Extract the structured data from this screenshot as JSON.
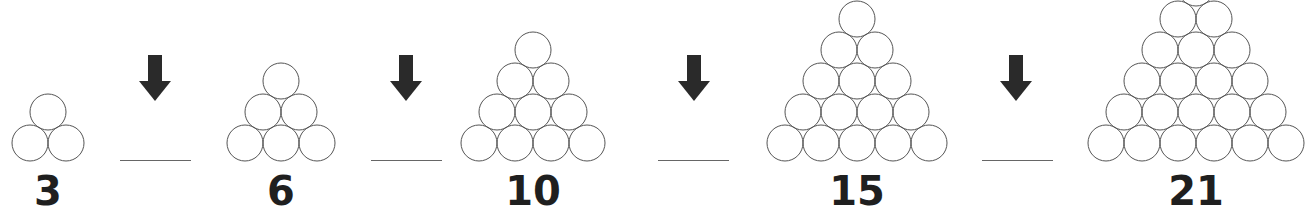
{
  "figure": {
    "items": [
      {
        "label": "3",
        "rows": 2
      },
      {
        "label": "6",
        "rows": 3
      },
      {
        "label": "10",
        "rows": 4
      },
      {
        "label": "15",
        "rows": 5
      },
      {
        "label": "21",
        "rows": 6
      }
    ],
    "blanks": [
      "",
      "",
      "",
      ""
    ],
    "colors": {
      "circle_stroke": "#555555",
      "arrow": "#2a2a2a",
      "number": "#1f1f1f"
    }
  }
}
